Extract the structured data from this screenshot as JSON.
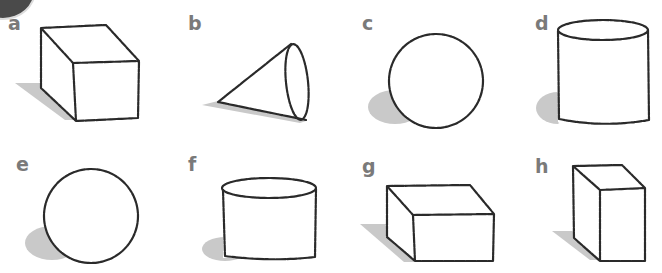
{
  "figure": {
    "label_color": "#7a7a7a",
    "stroke_color": "#2a2a2a",
    "shadow_color": "#c9c9c9",
    "panels": [
      {
        "label": "a",
        "shape": "cube"
      },
      {
        "label": "b",
        "shape": "cone"
      },
      {
        "label": "c",
        "shape": "sphere"
      },
      {
        "label": "d",
        "shape": "cylinder"
      },
      {
        "label": "e",
        "shape": "sphere"
      },
      {
        "label": "f",
        "shape": "cylinder"
      },
      {
        "label": "g",
        "shape": "cuboid"
      },
      {
        "label": "h",
        "shape": "cuboid"
      }
    ]
  }
}
